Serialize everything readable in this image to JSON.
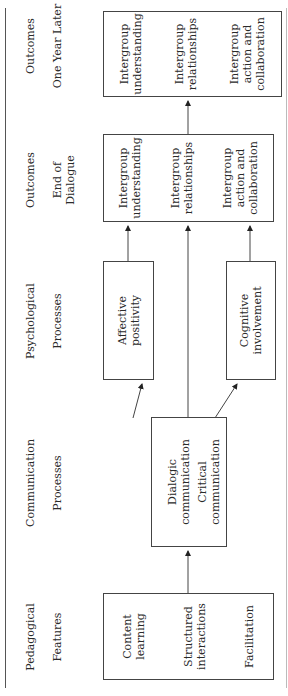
{
  "figure": {
    "columns": [
      {
        "id": "pedagogical",
        "header": [
          "Pedagogical",
          "Features"
        ]
      },
      {
        "id": "communication",
        "header": [
          "Communication",
          "Processes"
        ]
      },
      {
        "id": "psychological",
        "header": [
          "Psychological",
          "Processes"
        ]
      },
      {
        "id": "outcomes_end",
        "header": [
          "Outcomes",
          "End of\nDialogue"
        ]
      },
      {
        "id": "outcomes_later",
        "header": [
          "Outcomes",
          "One Year Later"
        ]
      }
    ],
    "boxes": {
      "pedagogical": [
        "Content\nlearning",
        "Structured\ninteractions",
        "Facilitation"
      ],
      "communication": [
        "Dialogic\ncommunication",
        "Critical communication"
      ],
      "affective": [
        "Affective\npositivity"
      ],
      "cognitive": [
        "Cognitive\ninvolvement"
      ],
      "outcomes_end": [
        "Intergroup\nunderstanding",
        "Intergroup\nrelationships",
        "Intergroup\naction and\ncollaboration"
      ],
      "outcomes_later": [
        "Intergroup\nunderstanding",
        "Intergroup\nrelationships",
        "Intergroup\naction and\ncollaboration"
      ]
    },
    "line_color": "#444444"
  }
}
